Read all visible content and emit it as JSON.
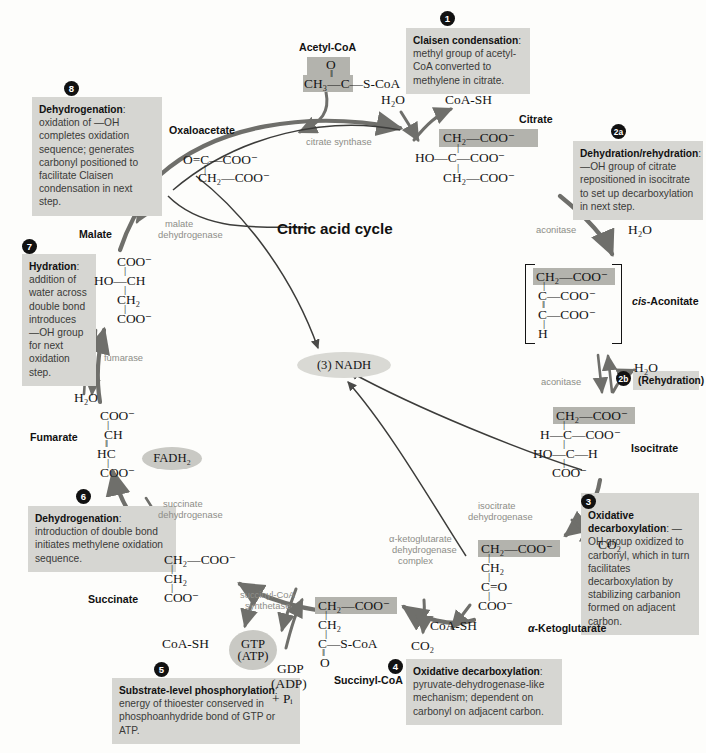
{
  "title": "Citric acid cycle",
  "colors": {
    "note_bg": "#d6d6d2",
    "highlight": "#b3b3ad",
    "pill": "#c9c9c4",
    "enzyme_text": "#8d8d88",
    "bullet_bg": "#111111",
    "arrow": "#6f6f6b",
    "ring": "#4a4a48"
  },
  "notes": [
    {
      "id": "note-1",
      "number": "1",
      "lead": "Claisen condensation",
      "body": ": methyl group of acetyl-CoA converted to methylene in citrate."
    },
    {
      "id": "note-2a",
      "number": "2a",
      "lead": "Dehydration/rehydration",
      "body": ": —OH group of citrate repositioned in isocitrate to set up decarboxylation in next step."
    },
    {
      "id": "note-2b",
      "number": "2b",
      "lead": "(Rehydration)",
      "body": ""
    },
    {
      "id": "note-3",
      "number": "3",
      "lead": "Oxidative decarboxylation",
      "body": ": —OH group oxidized to carbonyl, which in turn facilitates decarboxylation by stabilizing carbanion formed on adjacent carbon."
    },
    {
      "id": "note-4",
      "number": "4",
      "lead": "Oxidative decarboxylation",
      "body": ": pyruvate-dehydrogenase-like mechanism; dependent on carbonyl on adjacent carbon."
    },
    {
      "id": "note-5",
      "number": "5",
      "lead": "Substrate-level phosphorylation",
      "body": ": energy of thioester conserved in phosphoanhydride bond of GTP or ATP."
    },
    {
      "id": "note-6",
      "number": "6",
      "lead": "Dehydrogenation",
      "body": ": introduction of double bond initiates methylene oxidation sequence."
    },
    {
      "id": "note-7",
      "number": "7",
      "lead": "Hydration",
      "body": ": addition of water across double bond introduces —OH group for next oxidation step."
    },
    {
      "id": "note-8",
      "number": "8",
      "lead": "Dehydrogenation",
      "body": ": oxidation of —OH completes oxidation sequence; generates carbonyl positioned to facilitate Claisen condensation in next step."
    }
  ],
  "metabolites": {
    "acetyl_coa": "Acetyl-CoA",
    "citrate": "Citrate",
    "cis_aconitate_pre": "cis",
    "cis_aconitate_post": "-Aconitate",
    "isocitrate": "Isocitrate",
    "alpha_ketoglutarate_pre": "α",
    "alpha_ketoglutarate_post": "-Ketoglutarate",
    "succinyl_coa": "Succinyl-CoA",
    "succinate": "Succinate",
    "fumarate": "Fumarate",
    "malate": "Malate",
    "oxaloacetate": "Oxaloacetate"
  },
  "enzymes": {
    "citrate_synthase": "citrate synthase",
    "aconitase_1": "aconitase",
    "aconitase_2": "aconitase",
    "isocitrate_dehydrogenase_l1": "isocitrate",
    "isocitrate_dehydrogenase_l2": "dehydrogenase",
    "akg_complex_l1": "α-ketoglutarate",
    "akg_complex_l2": "dehydrogenase",
    "akg_complex_l3": "complex",
    "succinyl_coa_synthetase_l1": "succinyl-CoA",
    "succinyl_coa_synthetase_l2": "synthetase",
    "succinate_dehydrogenase_l1": "succinate",
    "succinate_dehydrogenase_l2": "dehydrogenase",
    "fumarase": "fumarase",
    "malate_dehydrogenase_l1": "malate",
    "malate_dehydrogenase_l2": "dehydrogenase"
  },
  "cofactors": {
    "water_1": "H₂O",
    "water_2": "H₂O",
    "water_3": "H₂O",
    "water_4": "H₂O",
    "coash_1": "CoA-SH",
    "coash_2": "CoA-SH",
    "coash_3": "CoA-SH",
    "co2_1": "CO₂",
    "co2_2": "CO₂",
    "nadh": "(3) NADH",
    "fadh2": "FADH₂",
    "gtp_line1": "GTP",
    "gtp_line2": "(ATP)",
    "gdp_line1": "GDP",
    "gdp_line2": "(ADP)",
    "gdp_line3": "+ Pᵢ"
  },
  "structures": {
    "acetyl_coa": [
      "O",
      "CH₃—C—S-CoA"
    ],
    "oxaloacetate": [
      "O=C—COO⁻",
      "CH₂—COO⁻"
    ],
    "citrate": [
      "CH₂—COO⁻",
      "HO—C—COO⁻",
      "CH₂—COO⁻"
    ],
    "cis_aconitate": [
      "CH₂—COO⁻",
      "C—COO⁻",
      "C—COO⁻",
      "H"
    ],
    "isocitrate": [
      "CH₂—COO⁻",
      "H—C—COO⁻",
      "HO—C—H",
      "COO⁻"
    ],
    "alpha_ketoglutarate": [
      "CH₂—COO⁻",
      "CH₂",
      "C=O",
      "COO⁻"
    ],
    "succinyl_coa": [
      "CH₂—COO⁻",
      "CH₂",
      "C—S-CoA",
      "O"
    ],
    "succinate": [
      "CH₂—COO⁻",
      "CH₂",
      "COO⁻"
    ],
    "fumarate": [
      "COO⁻",
      "CH",
      "HC",
      "COO⁻"
    ],
    "malate": [
      "COO⁻",
      "HO—CH",
      "CH₂",
      "COO⁻"
    ]
  }
}
